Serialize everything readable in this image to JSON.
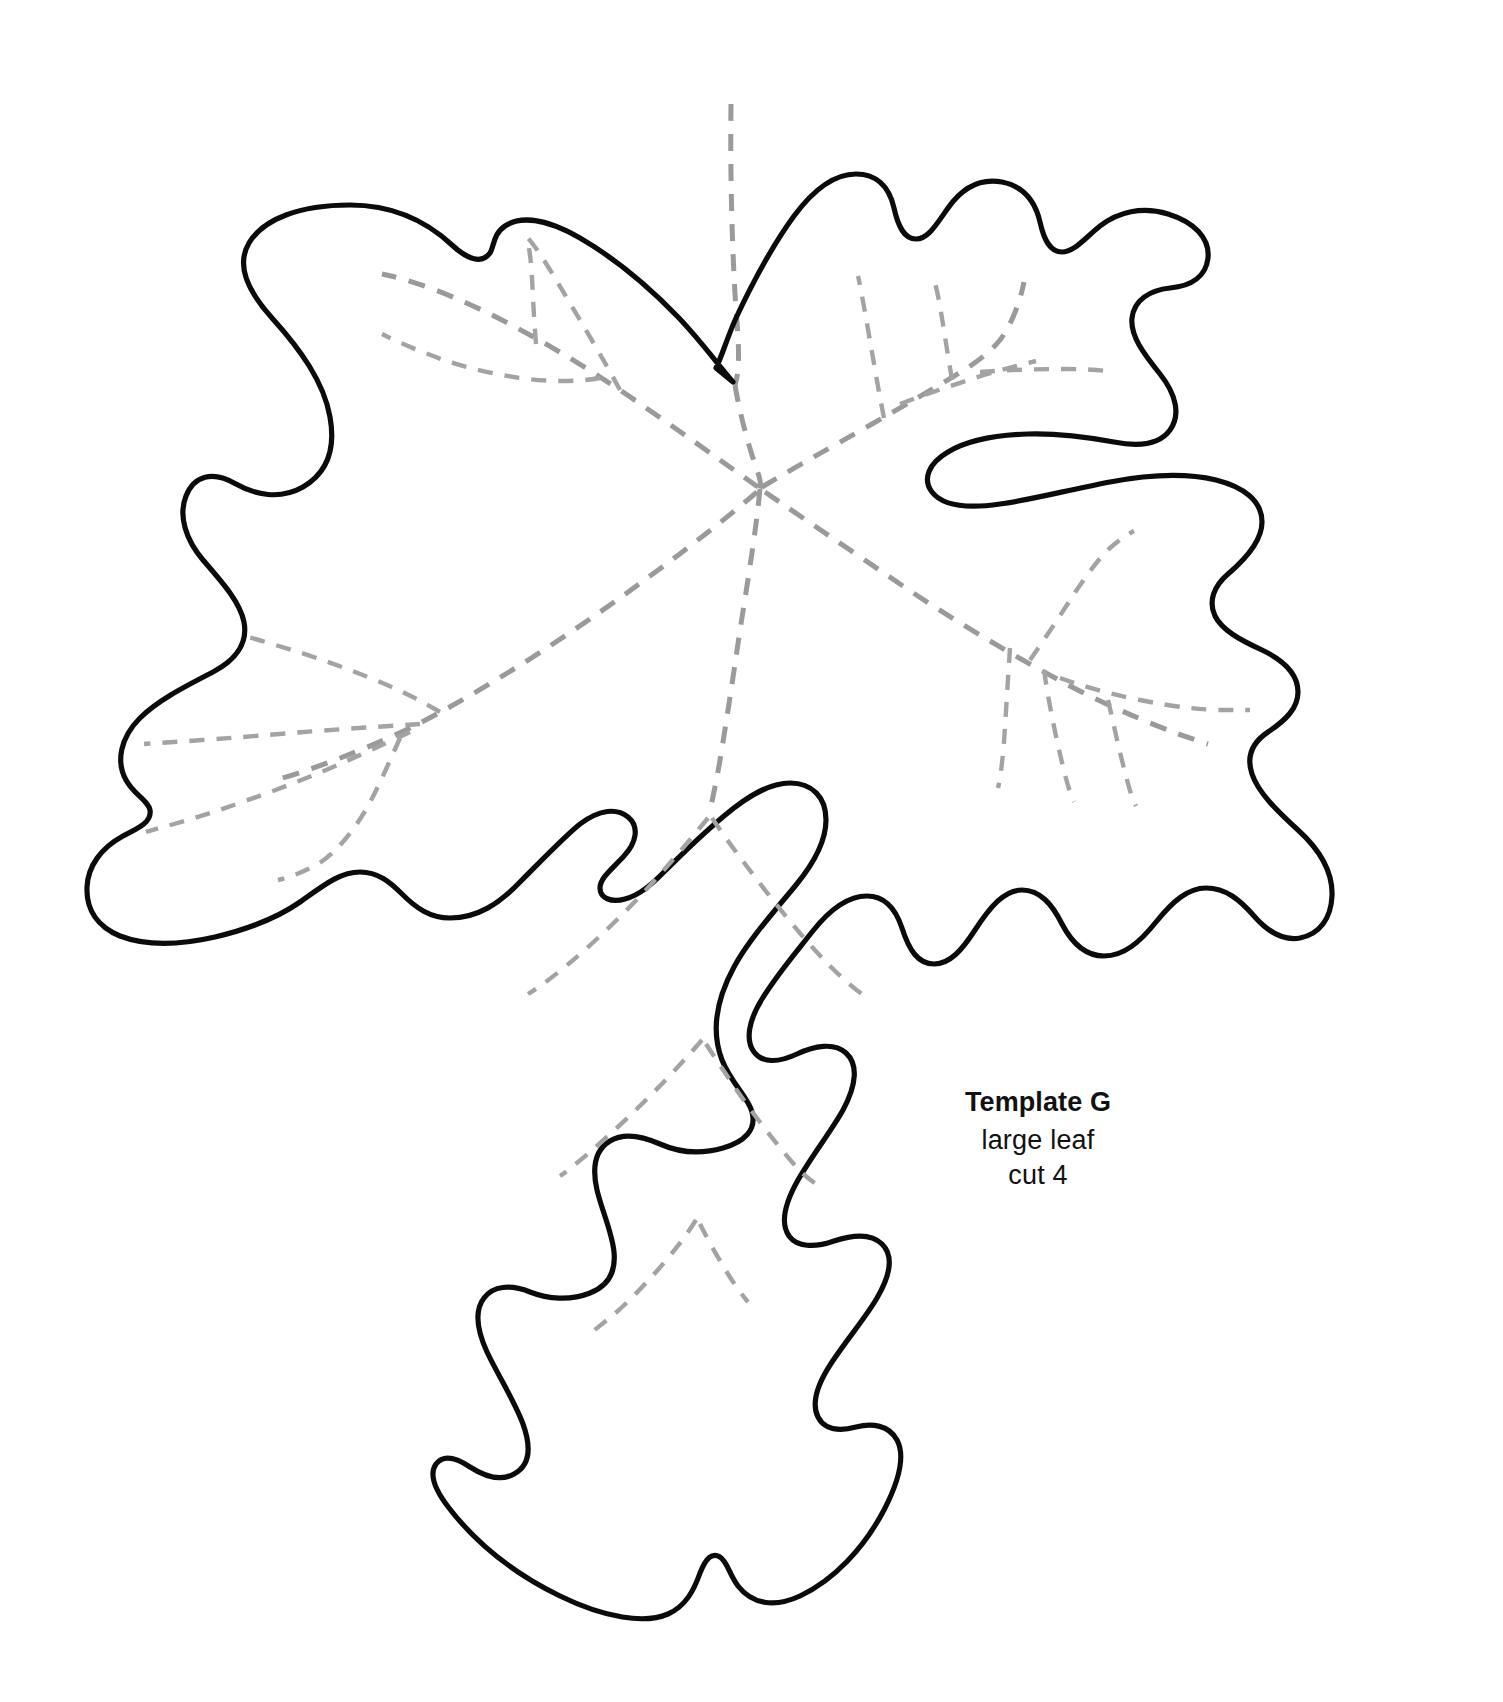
{
  "page": {
    "background_color": "#ffffff",
    "width": 1503,
    "height": 1702,
    "kind": "printable craft template"
  },
  "label": {
    "title": "Template G",
    "line_2": "large leaf",
    "line_3": "cut 4",
    "text_color": "#111111"
  },
  "artwork": {
    "subject": "maple leaf cutting template",
    "cut_line": {
      "name": "leaf-outline",
      "style": "solid",
      "color": "#0b0b0b",
      "stroke_width": 5.2
    },
    "fold_lines": {
      "name": "leaf-veins",
      "style": "dashed",
      "color": "#9a9a9a",
      "stroke_width": 5,
      "dash_pattern": "17 13"
    },
    "stem": {
      "name": "leaf-stem",
      "style": "dashed",
      "color": "#9a9a9a"
    }
  }
}
